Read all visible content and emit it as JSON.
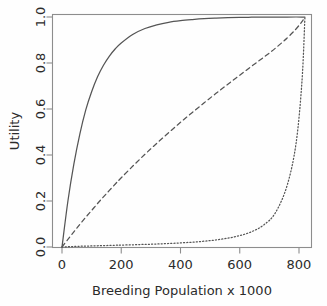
{
  "chart_data": {
    "type": "line",
    "title": "",
    "xlabel": "Breeding Population x 1000",
    "ylabel": "Utility",
    "xlim": [
      -30,
      855
    ],
    "ylim": [
      -0.03,
      1.03
    ],
    "xticks": [
      0,
      200,
      400,
      600,
      800
    ],
    "xtick_labels": [
      "0",
      "200",
      "400",
      "600",
      "800"
    ],
    "yticks": [
      0.0,
      0.2,
      0.4,
      0.6,
      0.8,
      1.0
    ],
    "ytick_labels": [
      "0.0",
      "0.2",
      "0.4",
      "0.6",
      "0.8",
      "1.0"
    ],
    "grid": false,
    "legend": "none",
    "frame": "box",
    "line_color": "#555555",
    "x": [
      0,
      20,
      40,
      60,
      80,
      100,
      120,
      140,
      160,
      180,
      200,
      240,
      280,
      320,
      360,
      400,
      440,
      480,
      520,
      560,
      600,
      640,
      680,
      720,
      760,
      790,
      810,
      820
    ],
    "series": [
      {
        "name": "concave-utility",
        "style": "solid",
        "values": [
          0.0,
          0.2,
          0.36,
          0.49,
          0.595,
          0.675,
          0.74,
          0.79,
          0.83,
          0.862,
          0.887,
          0.925,
          0.95,
          0.966,
          0.977,
          0.984,
          0.989,
          0.993,
          0.9955,
          0.9972,
          0.9983,
          0.999,
          0.9995,
          0.9998,
          0.9999,
          1.0,
          1.0,
          1.0
        ]
      },
      {
        "name": "linear-ish-utility",
        "style": "dashed",
        "values": [
          0.0,
          0.033,
          0.066,
          0.098,
          0.129,
          0.159,
          0.189,
          0.218,
          0.246,
          0.274,
          0.301,
          0.353,
          0.403,
          0.451,
          0.497,
          0.542,
          0.585,
          0.627,
          0.668,
          0.708,
          0.747,
          0.786,
          0.824,
          0.864,
          0.909,
          0.948,
          0.98,
          1.0
        ]
      },
      {
        "name": "convex-utility",
        "style": "dotted",
        "values": [
          0.0,
          0.0012,
          0.0022,
          0.0031,
          0.0039,
          0.0047,
          0.0054,
          0.0061,
          0.0068,
          0.0075,
          0.0082,
          0.0097,
          0.0113,
          0.0131,
          0.0152,
          0.0178,
          0.021,
          0.0252,
          0.0308,
          0.0385,
          0.0495,
          0.0665,
          0.095,
          0.148,
          0.268,
          0.45,
          0.72,
          1.0
        ]
      }
    ]
  },
  "axes": {
    "y_label_text": "Utility",
    "x_label_text": "Breeding Population x 1000"
  }
}
